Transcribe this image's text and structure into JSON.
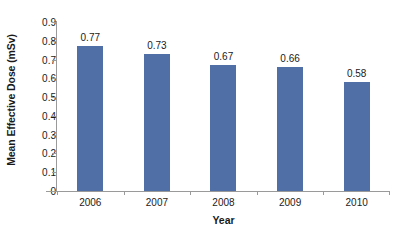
{
  "chart_data": {
    "type": "bar",
    "title": "",
    "categories": [
      "2006",
      "2007",
      "2008",
      "2009",
      "2010"
    ],
    "values": [
      0.77,
      0.73,
      0.67,
      0.66,
      0.58
    ],
    "data_labels": [
      "0.77",
      "0.73",
      "0.67",
      "0.66",
      "0.58"
    ],
    "xlabel": "Year",
    "ylabel": "Mean Effective Dose (mSv)",
    "ylim": [
      0,
      0.9
    ],
    "ytick_labels": [
      "0.9",
      "0.8",
      "0.7",
      "0.6",
      "0.5",
      "0.4",
      "0.3",
      "0.2",
      "0.1",
      "0"
    ],
    "ytick_values": [
      0.9,
      0.8,
      0.7,
      0.6,
      0.5,
      0.4,
      0.3,
      0.2,
      0.1,
      0
    ],
    "grid": false,
    "legend": false,
    "bar_color": "#4f6fa6",
    "axis_color": "#9a9a9a",
    "text_color": "#1a1a1a",
    "background": "#ffffff"
  }
}
